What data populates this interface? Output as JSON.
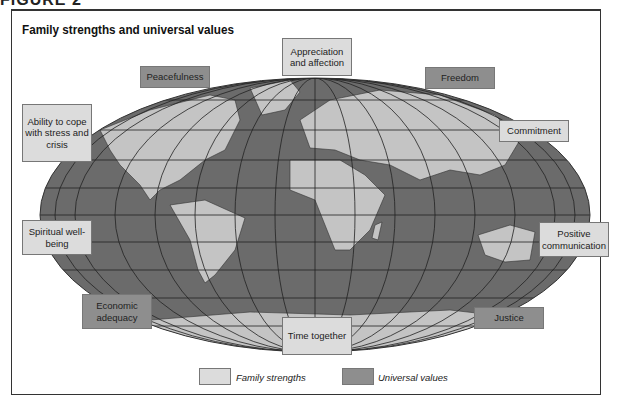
{
  "figure_label": "FIGURE 2",
  "title": "Family strengths and universal values",
  "colors": {
    "family_strengths": "#dcdcdc",
    "universal_values": "#8e8e8e",
    "ocean": "#6b6b6b",
    "land": "#c4c4c4"
  },
  "labels": {
    "appreciation": "Appreciation and affection",
    "peacefulness": "Peacefulness",
    "freedom": "Freedom",
    "ability": "Ability to cope with stress and crisis",
    "commitment": "Commitment",
    "spiritual": "Spiritual well-being",
    "positive": "Positive communication",
    "economic": "Economic adequacy",
    "time": "Time together",
    "justice": "Justice"
  },
  "legend": {
    "family_strengths": "Family strengths",
    "universal_values": "Universal values"
  }
}
